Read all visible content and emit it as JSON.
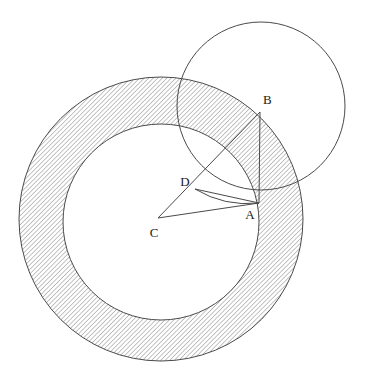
{
  "figure": {
    "canvas": {
      "width": 367,
      "height": 385
    },
    "background_color": "#ffffff",
    "stroke_color": "#4a4a4a",
    "hatch_color": "#6b6b6b",
    "label_color": "#1a1a1a"
  },
  "points": [
    {
      "id": "A",
      "label": "A",
      "x": 259,
      "y": 203,
      "label_x": 250,
      "label_y": 219
    },
    {
      "id": "B",
      "label": "B",
      "x": 260,
      "y": 112,
      "label_x": 263,
      "label_y": 104
    },
    {
      "id": "C",
      "label": "C",
      "x": 158,
      "y": 218,
      "label_x": 154,
      "label_y": 237
    },
    {
      "id": "D",
      "label": "D",
      "x": 195,
      "y": 189,
      "label_x": 185,
      "label_y": 186
    }
  ],
  "circles": [
    {
      "id": "outer-circle",
      "name": "outer-circle",
      "cx": 161,
      "cy": 219,
      "r": 142,
      "filled": false,
      "hatched": true,
      "note": "outer boundary of shaded annulus centred at C"
    },
    {
      "id": "inner-circle",
      "name": "inner-circle",
      "cx": 161,
      "cy": 222,
      "r": 98,
      "filled": false,
      "hatched": false,
      "note": "inner boundary of shaded annulus, unshaded interior"
    },
    {
      "id": "secondary-circle",
      "name": "secondary-circle",
      "cx": 261,
      "cy": 106,
      "r": 84,
      "filled": false,
      "hatched": false,
      "note": "upper-right circle passing through A and B"
    }
  ],
  "segments": [
    {
      "id": "seg-C-B",
      "name": "segment-c-to-b",
      "from": "C",
      "to": "B",
      "through": "D"
    },
    {
      "id": "seg-B-A",
      "name": "segment-b-to-a",
      "from": "B",
      "to": "A"
    },
    {
      "id": "seg-C-A",
      "name": "segment-c-to-a",
      "from": "C",
      "to": "A"
    },
    {
      "id": "seg-D-A",
      "name": "segment-d-to-a",
      "from": "D",
      "to": "A"
    }
  ],
  "arcs": [
    {
      "id": "arc-D-A",
      "name": "arc-d-to-a",
      "from": "D",
      "to": "A",
      "note": "curved arc bulging downward from D to A"
    }
  ],
  "shading": {
    "region": "annulus",
    "pattern": "diagonal-hatch",
    "angle_degrees": 45,
    "spacing_px": 3.2,
    "line_width_px": 0.8
  }
}
